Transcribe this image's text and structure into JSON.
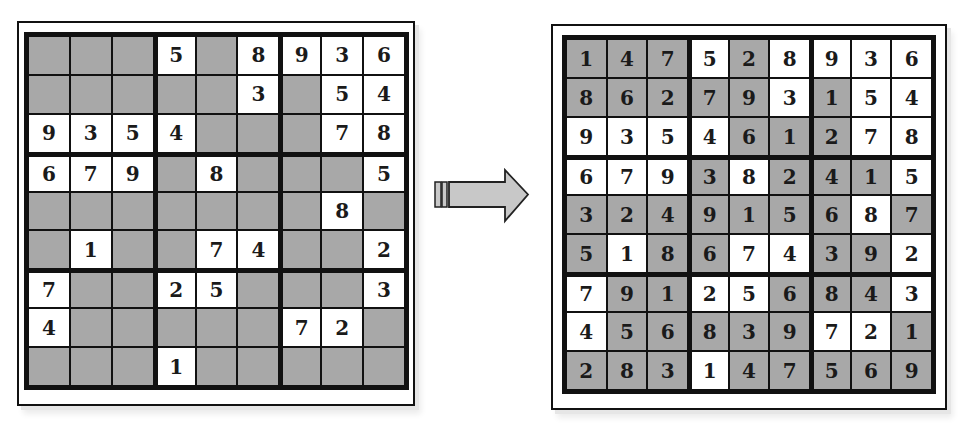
{
  "colors": {
    "given_cell": "#ffffff",
    "solved_cell": "#a8a8a8",
    "grid_line": "#111111",
    "arrow_fill": "#c8c8c8"
  },
  "arrow": {
    "icon": "right-arrow-icon",
    "direction": "right"
  },
  "puzzle": {
    "label": "Unsolved puzzle",
    "rows": [
      [
        "",
        "",
        "",
        "5",
        "",
        "8",
        "9",
        "3",
        "6"
      ],
      [
        "",
        "",
        "",
        "",
        "",
        "3",
        "",
        "5",
        "4"
      ],
      [
        "9",
        "3",
        "5",
        "4",
        "",
        "",
        "",
        "7",
        "8"
      ],
      [
        "6",
        "7",
        "9",
        "",
        "8",
        "",
        "",
        "",
        "5"
      ],
      [
        "",
        "",
        "",
        "",
        "",
        "",
        "",
        "8",
        ""
      ],
      [
        "",
        "1",
        "",
        "",
        "7",
        "4",
        "",
        "",
        "2"
      ],
      [
        "7",
        "",
        "",
        "2",
        "5",
        "",
        "",
        "",
        "3"
      ],
      [
        "4",
        "",
        "",
        "",
        "",
        "",
        "7",
        "2",
        ""
      ],
      [
        "",
        "",
        "",
        "1",
        "",
        "",
        "",
        "",
        ""
      ]
    ]
  },
  "solution": {
    "label": "Solved puzzle",
    "rows": [
      [
        "1",
        "4",
        "7",
        "5",
        "2",
        "8",
        "9",
        "3",
        "6"
      ],
      [
        "8",
        "6",
        "2",
        "7",
        "9",
        "3",
        "1",
        "5",
        "4"
      ],
      [
        "9",
        "3",
        "5",
        "4",
        "6",
        "1",
        "2",
        "7",
        "8"
      ],
      [
        "6",
        "7",
        "9",
        "3",
        "8",
        "2",
        "4",
        "1",
        "5"
      ],
      [
        "3",
        "2",
        "4",
        "9",
        "1",
        "5",
        "6",
        "8",
        "7"
      ],
      [
        "5",
        "1",
        "8",
        "6",
        "7",
        "4",
        "3",
        "9",
        "2"
      ],
      [
        "7",
        "9",
        "1",
        "2",
        "5",
        "6",
        "8",
        "4",
        "3"
      ],
      [
        "4",
        "5",
        "6",
        "8",
        "3",
        "9",
        "7",
        "2",
        "1"
      ],
      [
        "2",
        "8",
        "3",
        "1",
        "4",
        "7",
        "5",
        "6",
        "9"
      ]
    ],
    "given_mask": [
      [
        0,
        0,
        0,
        1,
        0,
        1,
        1,
        1,
        1
      ],
      [
        0,
        0,
        0,
        0,
        0,
        1,
        0,
        1,
        1
      ],
      [
        1,
        1,
        1,
        1,
        0,
        0,
        0,
        1,
        1
      ],
      [
        1,
        1,
        1,
        0,
        1,
        0,
        0,
        0,
        1
      ],
      [
        0,
        0,
        0,
        0,
        0,
        0,
        0,
        1,
        0
      ],
      [
        0,
        1,
        0,
        0,
        1,
        1,
        0,
        0,
        1
      ],
      [
        1,
        0,
        0,
        1,
        1,
        0,
        0,
        0,
        1
      ],
      [
        1,
        0,
        0,
        0,
        0,
        0,
        1,
        1,
        0
      ],
      [
        0,
        0,
        0,
        1,
        0,
        0,
        0,
        0,
        0
      ]
    ]
  }
}
